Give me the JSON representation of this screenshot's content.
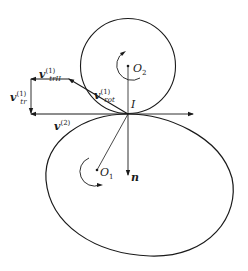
{
  "diagram": {
    "type": "kinematic-contact",
    "colors": {
      "stroke": "#1a1a1a",
      "background": "#ffffff"
    },
    "points": {
      "O2": {
        "label": "O",
        "sub": "2"
      },
      "O1": {
        "label": "O",
        "sub": "1"
      },
      "I": {
        "label": "I"
      }
    },
    "vectors": {
      "v_trII": {
        "symbol": "v",
        "sup": "(1)",
        "sub": "trII"
      },
      "v_tr": {
        "symbol": "v",
        "sup": "(1)",
        "sub": "tr"
      },
      "v_rot": {
        "symbol": "v",
        "sup": "(1)",
        "sub": "rot"
      },
      "v2": {
        "symbol": "v",
        "sup": "(2)",
        "sub": ""
      },
      "n": {
        "symbol": "n"
      }
    }
  }
}
